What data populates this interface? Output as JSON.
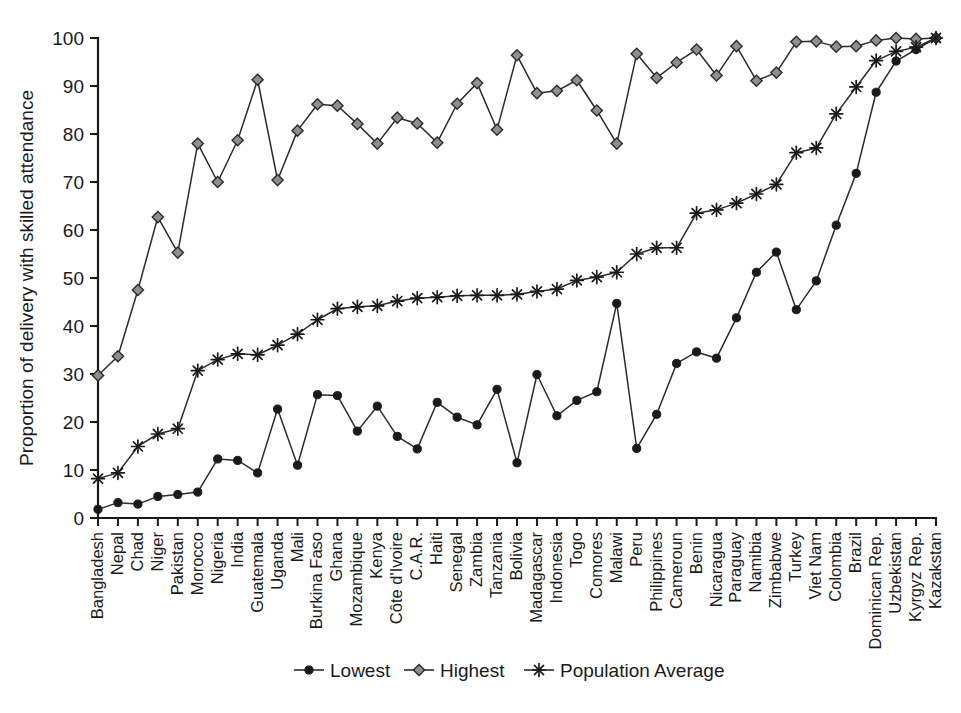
{
  "chart_data": {
    "type": "line",
    "title": "",
    "xlabel": "",
    "ylabel": "Proportion of delivery with skilled attendance",
    "ylim": [
      0,
      100
    ],
    "yticks": [
      0,
      10,
      20,
      30,
      40,
      50,
      60,
      70,
      80,
      90,
      100
    ],
    "grid": false,
    "legend_position": "bottom",
    "categories": [
      "Bangladesh",
      "Nepal",
      "Chad",
      "Niger",
      "Pakistan",
      "Morocco",
      "Nigeria",
      "India",
      "Guatemala",
      "Uganda",
      "Mali",
      "Burkina Faso",
      "Ghana",
      "Mozambique",
      "Kenya",
      "Côte d'Ivoire",
      "C.A.R.",
      "Haiti",
      "Senegal",
      "Zambia",
      "Tanzania",
      "Bolivia",
      "Madagascar",
      "Indonesia",
      "Togo",
      "Comores",
      "Malawi",
      "Peru",
      "Philippines",
      "Cameroun",
      "Benin",
      "Nicaragua",
      "Paraguay",
      "Namibia",
      "Zimbabwe",
      "Turkey",
      "Viet Nam",
      "Colombia",
      "Brazil",
      "Dominican Rep.",
      "Uzbekistan",
      "Kyrgyz Rep.",
      "Kazakstan"
    ],
    "series": [
      {
        "name": "Lowest",
        "marker": "circle",
        "values": [
          1.8,
          3.2,
          2.9,
          4.5,
          4.9,
          5.4,
          12.3,
          12.0,
          9.4,
          22.7,
          11.0,
          25.7,
          25.5,
          18.1,
          23.3,
          17.0,
          14.4,
          24.1,
          21.0,
          19.4,
          26.8,
          11.5,
          29.9,
          21.3,
          24.5,
          26.3,
          44.7,
          14.5,
          21.6,
          32.2,
          34.6,
          33.3,
          41.7,
          51.2,
          55.4,
          43.4,
          49.4,
          61.0,
          71.8,
          88.7,
          95.2,
          97.6,
          100.0
        ]
      },
      {
        "name": "Highest",
        "marker": "diamond",
        "values": [
          29.7,
          33.7,
          47.5,
          62.7,
          55.3,
          78.0,
          70.0,
          78.7,
          91.3,
          70.4,
          80.7,
          86.2,
          85.9,
          82.1,
          78.0,
          83.4,
          82.2,
          78.2,
          86.3,
          90.6,
          80.9,
          96.4,
          88.5,
          89.0,
          91.2,
          84.9,
          78.0,
          96.7,
          91.7,
          94.9,
          97.6,
          92.2,
          98.3,
          91.1,
          92.8,
          99.2,
          99.3,
          98.2,
          98.3,
          99.5,
          100.0,
          99.8,
          100.0
        ]
      },
      {
        "name": "Population Average",
        "marker": "star",
        "values": [
          8.2,
          9.4,
          14.9,
          17.5,
          18.6,
          30.7,
          33.0,
          34.2,
          34.0,
          36.0,
          38.3,
          41.3,
          43.6,
          44.0,
          44.2,
          45.2,
          45.8,
          46.0,
          46.3,
          46.4,
          46.4,
          46.6,
          47.2,
          47.7,
          49.5,
          50.2,
          51.2,
          55.0,
          56.3,
          56.3,
          63.5,
          64.2,
          65.6,
          67.5,
          69.5,
          76.1,
          77.1,
          84.2,
          89.8,
          95.3,
          97.2,
          98.1,
          100.0
        ]
      }
    ]
  },
  "legend": {
    "items": [
      {
        "label": "Lowest",
        "marker": "circle"
      },
      {
        "label": "Highest",
        "marker": "diamond"
      },
      {
        "label": "Population Average",
        "marker": "star"
      }
    ]
  }
}
